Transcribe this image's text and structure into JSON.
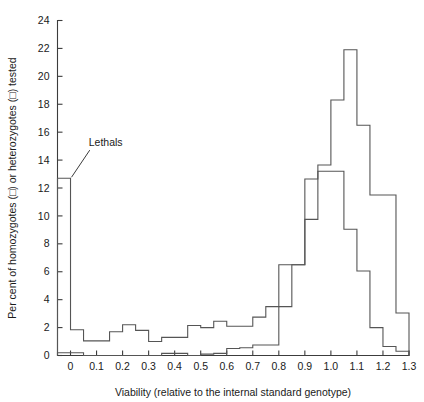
{
  "chart_data": {
    "type": "line",
    "title": "",
    "subtitle": "",
    "xlabel": "Viability (relative to the internal standard genotype)",
    "ylabel": "Per cent of homozygotes (□) or heterozygotes (□) tested",
    "xlim": [
      -0.05,
      1.3
    ],
    "ylim": [
      0,
      24
    ],
    "grid": false,
    "legend_position": "none",
    "xticks": [
      0,
      0.1,
      0.2,
      0.3,
      0.4,
      0.5,
      0.6,
      0.7,
      0.8,
      0.9,
      1.0,
      1.1,
      1.2,
      1.3
    ],
    "xtick_labels": [
      "0",
      "0.1",
      "0.2",
      "0.3",
      "0.4",
      "0.5",
      "0.6",
      "0.7",
      "0.8",
      "0.9",
      "1.0",
      "1.1",
      "1.2",
      "1.3"
    ],
    "yticks": [
      0,
      2,
      4,
      6,
      8,
      10,
      12,
      14,
      16,
      18,
      20,
      22,
      24
    ],
    "ytick_labels": [
      "0",
      "2",
      "4",
      "6",
      "8",
      "10",
      "12",
      "14",
      "16",
      "18",
      "20",
      "22",
      "24"
    ],
    "bin_width": 0.05,
    "bin_edges": [
      -0.05,
      0.0,
      0.05,
      0.1,
      0.15,
      0.2,
      0.25,
      0.3,
      0.35,
      0.4,
      0.45,
      0.5,
      0.55,
      0.6,
      0.65,
      0.7,
      0.75,
      0.8,
      0.85,
      0.9,
      0.95,
      1.0,
      1.05,
      1.1,
      1.15,
      1.2,
      1.25,
      1.3
    ],
    "series": [
      {
        "name": "homozygotes",
        "color": "#555555",
        "values": [
          12.7,
          1.85,
          1.05,
          1.05,
          1.7,
          2.2,
          1.8,
          1.0,
          1.3,
          1.3,
          2.15,
          2.0,
          2.45,
          2.1,
          2.1,
          2.75,
          3.5,
          6.5,
          6.5,
          9.75,
          13.65,
          18.3,
          21.9,
          16.5,
          11.5,
          11.5,
          3.05,
          1.85
        ]
      },
      {
        "name": "heterozygotes",
        "color": "#555555",
        "values": [
          0.2,
          0.2,
          0.0,
          0.0,
          0.0,
          0.0,
          0.0,
          0.0,
          0.15,
          0.15,
          0.0,
          0.1,
          0.15,
          0.5,
          0.55,
          0.75,
          0.75,
          3.5,
          6.5,
          12.65,
          13.2,
          13.2,
          9.05,
          6.05,
          2.0,
          0.65,
          0.3,
          0.2
        ]
      }
    ],
    "annotations": [
      {
        "label": "Lethals",
        "text_x": 0.07,
        "text_y": 15.0,
        "point_x": 0.0,
        "point_y": 12.7
      }
    ]
  }
}
